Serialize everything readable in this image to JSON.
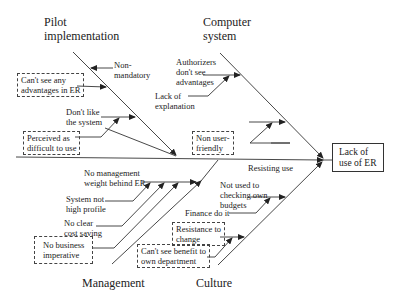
{
  "diagram": {
    "type": "fishbone",
    "effect": {
      "line1": "Lack of",
      "line2": "use of ER"
    },
    "spine_label": "Resisting use",
    "categories": {
      "pilot": {
        "line1": "Pilot",
        "line2": "implementation"
      },
      "computer": {
        "line1": "Computer",
        "line2": "system"
      },
      "management": {
        "line1": "Management"
      },
      "culture": {
        "line1": "Culture"
      }
    },
    "causes": {
      "pilot": [
        {
          "line1": "Non-",
          "line2": "mandatory",
          "boxed": false
        },
        {
          "line1": "Can't see any",
          "line2": "advantages in ER",
          "boxed": true
        },
        {
          "line1": "Don't like",
          "line2": "the system",
          "boxed": false
        },
        {
          "line1": "Perceived as",
          "line2": "difficult to use",
          "boxed": true
        }
      ],
      "computer": [
        {
          "line1": "Authorizers",
          "line2": "don't see",
          "line3": "advantages",
          "boxed": false
        },
        {
          "line1": "Lack of",
          "line2": "explanation",
          "boxed": false
        },
        {
          "line1": "Non user-",
          "line2": "friendly",
          "boxed": true
        }
      ],
      "management": [
        {
          "line1": "No management",
          "line2": "weight behind ER",
          "boxed": false
        },
        {
          "line1": "System not",
          "line2": "high profile",
          "boxed": false
        },
        {
          "line1": "No clear",
          "line2": "cost saving",
          "boxed": false
        },
        {
          "line1": "No business",
          "line2": "imperative",
          "boxed": true
        }
      ],
      "culture": [
        {
          "line1": "Not used to",
          "line2": "checking own",
          "line3": "budgets",
          "boxed": false
        },
        {
          "line1": "Finance do it",
          "boxed": false
        },
        {
          "line1": "Resistance to",
          "line2": "change",
          "boxed": true
        },
        {
          "line1": "Can't see benefit to",
          "line2": "own department",
          "boxed": true
        }
      ]
    }
  }
}
